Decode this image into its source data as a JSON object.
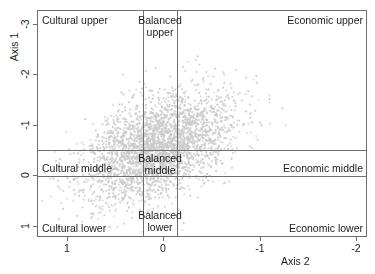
{
  "chart_data": {
    "type": "scatter",
    "title": "",
    "xlabel": "Axis 2",
    "ylabel": "Axis 1",
    "xlim": [
      1.3,
      -2.1
    ],
    "ylim": [
      -3.25,
      1.2
    ],
    "x_ticks": [
      {
        "value": "1",
        "pos": 1
      },
      {
        "value": "0",
        "pos": 0
      },
      {
        "value": "-1",
        "pos": -1
      },
      {
        "value": "-2",
        "pos": -2
      }
    ],
    "y_ticks": [
      {
        "value": "-3",
        "pos": -3
      },
      {
        "value": "-2",
        "pos": -2
      },
      {
        "value": "-1",
        "pos": -1
      },
      {
        "value": "0",
        "pos": 0
      },
      {
        "value": "1",
        "pos": 1
      }
    ],
    "grid": false,
    "legend": "none",
    "point_color": "#c9c9c9",
    "point_size": 1.1,
    "n_points": 3000,
    "cloud_center": {
      "x": 0.05,
      "y": -0.55
    },
    "cloud_spread": {
      "x": 0.38,
      "y": 0.55
    },
    "axis_color": "#6e6e6e",
    "partition_lines": {
      "vertical": [
        0.215,
        -0.145
      ],
      "horizontal": [
        -0.5,
        0.02
      ]
    },
    "annotations": [
      {
        "id": "cultural-upper",
        "text": "Cultural upper",
        "region": "top-left"
      },
      {
        "id": "balanced-upper",
        "text": "Balanced upper",
        "region": "top-center"
      },
      {
        "id": "economic-upper",
        "text": "Economic upper",
        "region": "top-right"
      },
      {
        "id": "cultural-middle",
        "text": "Cultural middle",
        "region": "middle-left"
      },
      {
        "id": "balanced-middle",
        "text": "Balanced middle",
        "region": "middle-center"
      },
      {
        "id": "economic-middle",
        "text": "Economic middle",
        "region": "middle-right"
      },
      {
        "id": "cultural-lower",
        "text": "Cultural lower",
        "region": "bottom-left"
      },
      {
        "id": "balanced-lower",
        "text": "Balanced lower",
        "region": "bottom-center"
      },
      {
        "id": "economic-lower",
        "text": "Economic lower",
        "region": "bottom-right"
      }
    ]
  }
}
